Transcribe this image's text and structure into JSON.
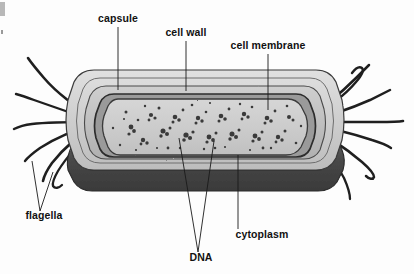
{
  "diagram": {
    "style": "grayscale pencil/ink textbook illustration",
    "background_color": "#fdfdfd"
  },
  "labels": {
    "capsule": "capsule",
    "cell_wall": "cell wall",
    "cell_membrane": "cell membrane",
    "flagella": "flagella",
    "dna": "DNA",
    "cytoplasm": "cytoplasm"
  },
  "label_positions": {
    "capsule": {
      "x": 118,
      "y": 22,
      "anchor": "middle"
    },
    "cell_wall": {
      "x": 186,
      "y": 36,
      "anchor": "middle"
    },
    "cell_membrane": {
      "x": 268,
      "y": 49,
      "anchor": "middle"
    },
    "flagella": {
      "x": 44,
      "y": 219,
      "anchor": "middle"
    },
    "dna": {
      "x": 201,
      "y": 261,
      "anchor": "middle"
    },
    "cytoplasm": {
      "x": 262,
      "y": 238,
      "anchor": "middle"
    }
  },
  "leader_lines": {
    "capsule": {
      "from": [
        118,
        27
      ],
      "to": [
        118,
        90
      ]
    },
    "cell_wall": {
      "from": [
        186,
        41
      ],
      "to": [
        186,
        91
      ]
    },
    "cell_membrane": {
      "from": [
        268,
        54
      ],
      "to": [
        268,
        110
      ]
    },
    "flagella": {
      "points": [
        [
          32,
          161
        ],
        [
          40,
          211
        ],
        [
          53,
          172
        ]
      ]
    },
    "dna": {
      "points": [
        [
          179,
          138
        ],
        [
          198,
          252
        ],
        [
          214,
          141
        ]
      ]
    },
    "cytoplasm": {
      "from": [
        238,
        155
      ],
      "to": [
        238,
        229
      ]
    }
  },
  "colors": {
    "capsule_outer": "#d3d3d3",
    "capsule_inner": "#c2c2c2",
    "cell_wall": "#b4b4b4",
    "cell_membrane": "#8f8f8f",
    "cytoplasm": "#cacaca",
    "dna_granule": "#3a3a3a",
    "bottom_shadow": "#4a4a4a",
    "bottom_shadow_dark": "#3d3d3d",
    "outline": "#2a2a2a",
    "flagella": "#1f1f1f",
    "label_text": "#111111"
  },
  "structures": [
    {
      "name": "capsule",
      "description": "outermost slime layer, light gray band"
    },
    {
      "name": "cell wall",
      "description": "rigid layer beneath capsule"
    },
    {
      "name": "cell membrane",
      "description": "dark thin inner boundary line"
    },
    {
      "name": "cytoplasm",
      "description": "light gray interior fluid with granules"
    },
    {
      "name": "DNA",
      "description": "dark nucleoid granule clusters in cytoplasm"
    },
    {
      "name": "flagella",
      "description": "whip-like tails at both cell poles"
    }
  ],
  "flagella_counts": {
    "left": 6,
    "right": 7
  }
}
